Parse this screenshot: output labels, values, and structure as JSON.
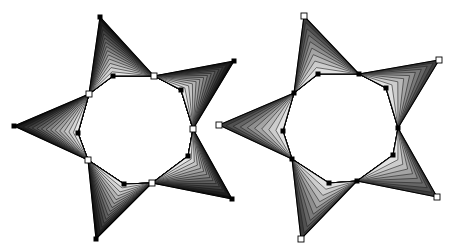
{
  "canvas": {
    "width": 452,
    "height": 248,
    "background": "#ffffff"
  },
  "stars": [
    {
      "name": "left-star",
      "steps": 14,
      "dark_color": "#0d0d0d",
      "light_color": "#e6e6e6",
      "stroke_color": "#1a1a1a",
      "tip_marker": "black",
      "side_marker": "white",
      "inner_marker": "black",
      "arms": [
        {
          "left": [
            89,
            94
          ],
          "tip": [
            100,
            17
          ],
          "right": [
            154,
            76
          ],
          "inner": [
            113,
            76
          ]
        },
        {
          "left": [
            154,
            76
          ],
          "tip": [
            234,
            61
          ],
          "right": [
            193,
            129
          ],
          "inner": [
            181,
            90
          ]
        },
        {
          "left": [
            193,
            129
          ],
          "tip": [
            232,
            199
          ],
          "right": [
            152,
            183
          ],
          "inner": [
            188,
            156
          ]
        },
        {
          "left": [
            152,
            183
          ],
          "tip": [
            96,
            239
          ],
          "right": [
            88,
            160
          ],
          "inner": [
            124,
            184
          ]
        },
        {
          "left": [
            88,
            160
          ],
          "tip": [
            14,
            126
          ],
          "right": [
            89,
            94
          ],
          "inner": [
            78,
            133
          ]
        }
      ]
    },
    {
      "name": "right-star",
      "steps": 9,
      "dark_color": "#3c3c3c",
      "light_color": "#e2e2e2",
      "stroke_color": "#222222",
      "tip_marker": "white",
      "side_marker": "black",
      "inner_marker": "black",
      "arms": [
        {
          "left": [
            294,
            93
          ],
          "tip": [
            304,
            16
          ],
          "right": [
            359,
            74
          ],
          "inner": [
            318,
            74
          ]
        },
        {
          "left": [
            359,
            74
          ],
          "tip": [
            439,
            60
          ],
          "right": [
            398,
            128
          ],
          "inner": [
            386,
            88
          ]
        },
        {
          "left": [
            398,
            128
          ],
          "tip": [
            437,
            197
          ],
          "right": [
            357,
            181
          ],
          "inner": [
            393,
            155
          ]
        },
        {
          "left": [
            357,
            181
          ],
          "tip": [
            301,
            239
          ],
          "right": [
            292,
            159
          ],
          "inner": [
            329,
            183
          ]
        },
        {
          "left": [
            292,
            159
          ],
          "tip": [
            219,
            125
          ],
          "right": [
            294,
            93
          ],
          "inner": [
            283,
            131
          ]
        }
      ]
    }
  ]
}
